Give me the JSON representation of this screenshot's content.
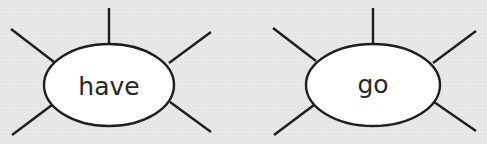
{
  "diagram": {
    "type": "word-web",
    "colors": {
      "background": "#e7e7e7",
      "ellipse_fill": "#ffffff",
      "stroke": "#1e1e1e",
      "text": "#262626"
    },
    "nodes": [
      {
        "label": "have",
        "spokes": 5
      },
      {
        "label": "go",
        "spokes": 5
      }
    ]
  }
}
